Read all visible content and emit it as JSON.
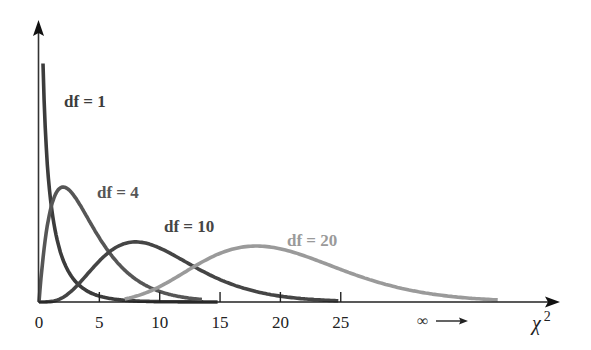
{
  "chart_data": {
    "type": "line",
    "title": "",
    "xlabel": "χ²",
    "ylabel": "",
    "xlim": [
      0,
      43
    ],
    "x_ticks": [
      0,
      5,
      10,
      15,
      20,
      25
    ],
    "x_tick_labels": [
      "0",
      "5",
      "10",
      "15",
      "20",
      "25"
    ],
    "infinity_annotation": "∞ ⟶",
    "grid": false,
    "legend": "inline labels",
    "series": [
      {
        "name": "df = 1",
        "df": 1,
        "color": "#3c3c3c",
        "x_start": 0.33,
        "x_end": 14.8,
        "y_scale": 405
      },
      {
        "name": "df = 4",
        "df": 4,
        "color": "#565656",
        "x_start": 0.0,
        "x_end": 13.5,
        "y_scale": 625
      },
      {
        "name": "df = 10",
        "df": 10,
        "color": "#454545",
        "x_start": 0.0,
        "x_end": 24.8,
        "y_scale": 615
      },
      {
        "name": "df = 20",
        "df": 20,
        "color": "#9a9a9a",
        "x_start": 7.1,
        "x_end": 38.0,
        "y_scale": 850
      }
    ],
    "labels": [
      {
        "text": "df = 1",
        "x": 64,
        "y": 107,
        "color": "#3c3c3c"
      },
      {
        "text": "df = 4",
        "x": 97,
        "y": 198,
        "color": "#565656"
      },
      {
        "text": "df = 10",
        "x": 164,
        "y": 232,
        "color": "#454545"
      },
      {
        "text": "df = 20",
        "x": 287,
        "y": 246,
        "color": "#9a9a9a"
      }
    ]
  },
  "axes": {
    "x_label": "χ",
    "x_label_sup": "2",
    "infinity": "∞",
    "origin_px": [
      39,
      302
    ],
    "px_per_unit": 12.07,
    "x_axis_end_px": 560,
    "y_axis_top_px": 20
  }
}
